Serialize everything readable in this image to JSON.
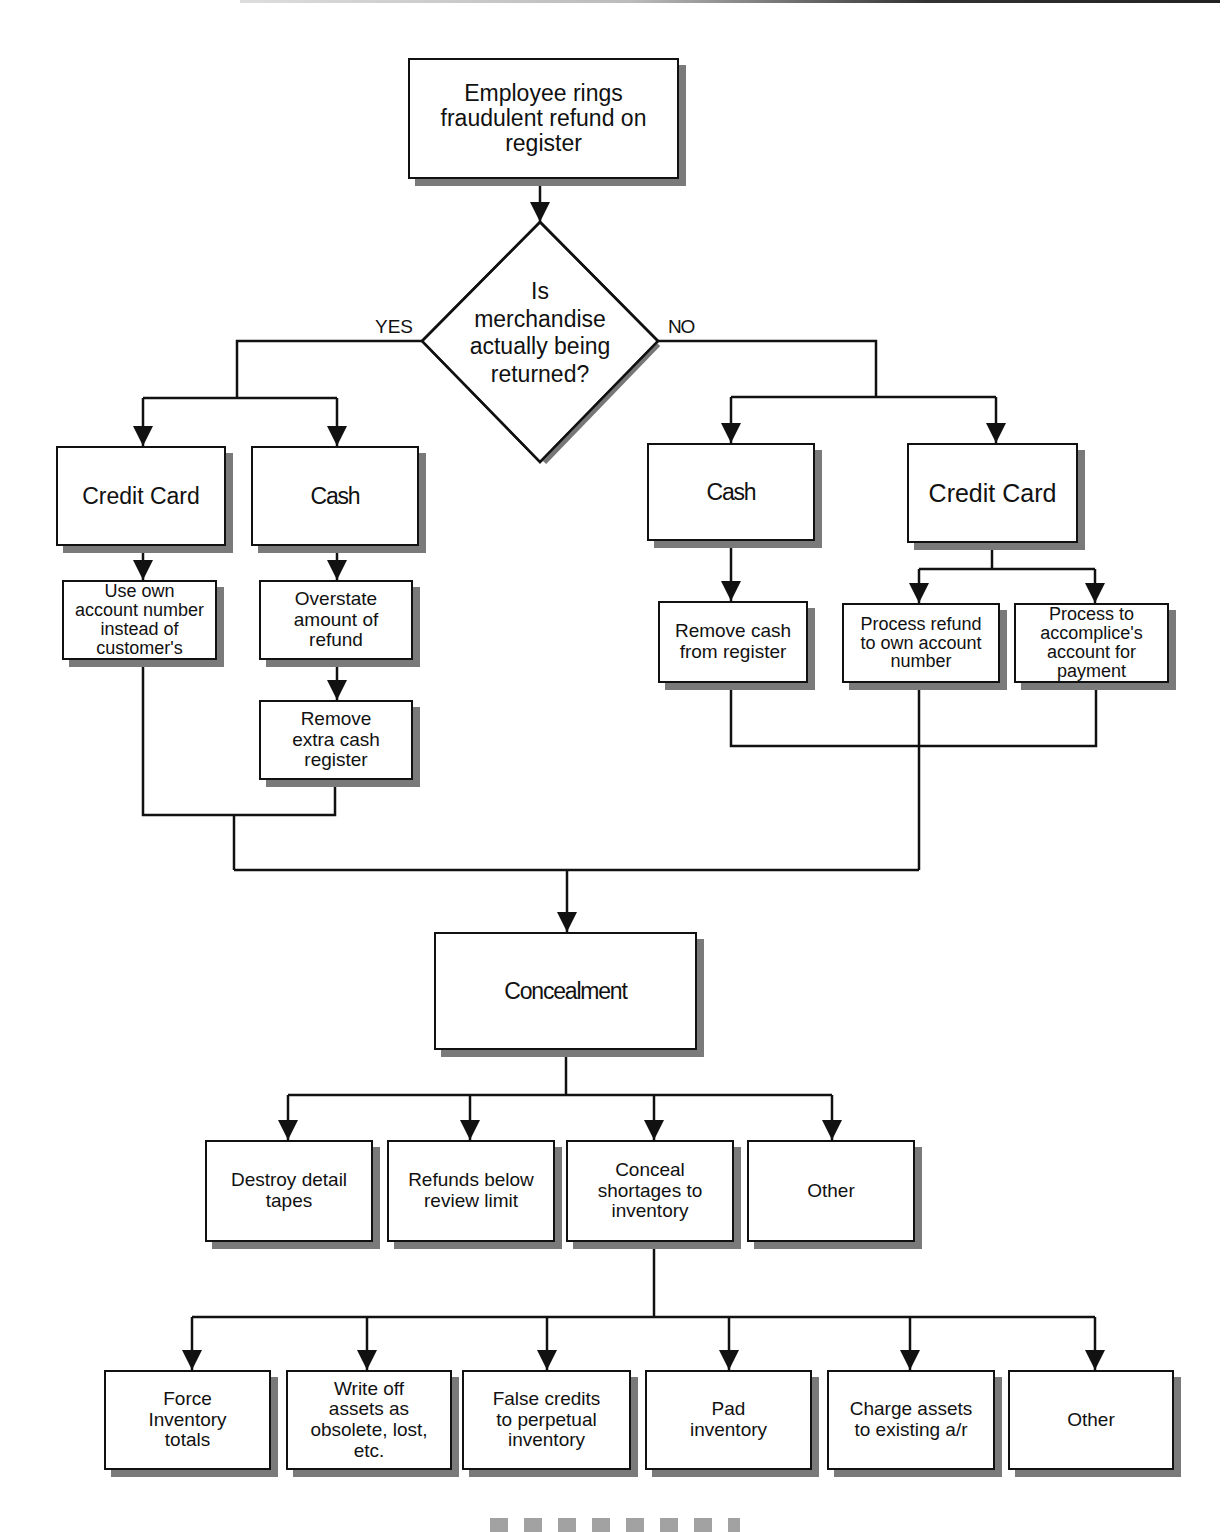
{
  "diagram": {
    "start": {
      "label": "Employee rings\nfraudulent refund on\nregister"
    },
    "decision": {
      "question": "Is\nmerchandise\nactually being\nreturned?",
      "yes_label": "YES",
      "no_label": "NO"
    },
    "yes_branch": {
      "credit_card": {
        "label": "Credit Card",
        "steps": [
          "Use own\naccount number\ninstead of\ncustomer's"
        ]
      },
      "cash": {
        "label": "Cash",
        "steps": [
          "Overstate\namount of\nrefund",
          "Remove\nextra cash\nregister"
        ]
      }
    },
    "no_branch": {
      "cash": {
        "label": "Cash",
        "steps": [
          "Remove cash\nfrom register"
        ]
      },
      "credit_card": {
        "label": "Credit Card",
        "steps": [
          "Process refund\nto own account\nnumber",
          "Process to\naccomplice's\naccount for\npayment"
        ]
      }
    },
    "concealment": {
      "label": "Concealment",
      "methods": [
        {
          "label": "Destroy detail\ntapes"
        },
        {
          "label": "Refunds below\nreview limit"
        },
        {
          "label": "Conceal\nshortages to\ninventory"
        },
        {
          "label": "Other"
        }
      ],
      "inventory_methods": [
        {
          "label": "Force\nInventory\ntotals"
        },
        {
          "label": "Write off\nassets as\nobsolete, lost,\netc."
        },
        {
          "label": "False credits\nto perpetual\ninventory"
        },
        {
          "label": "Pad\ninventory"
        },
        {
          "label": "Charge assets\nto existing a/r"
        },
        {
          "label": "Other"
        }
      ]
    }
  },
  "colors": {
    "line": "#111111",
    "shadow": "#7a7a7a",
    "background": "#ffffff"
  }
}
